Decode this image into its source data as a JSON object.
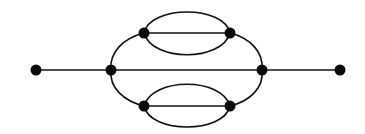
{
  "diagram": {
    "type": "graph",
    "colors": {
      "stroke": "#111111",
      "node": "#0a0a0a",
      "background": "#ffffff"
    },
    "nodes": [
      {
        "id": "left-end",
        "x": 36,
        "y": 70
      },
      {
        "id": "left-inner",
        "x": 111,
        "y": 70
      },
      {
        "id": "top-left",
        "x": 144,
        "y": 33
      },
      {
        "id": "top-right",
        "x": 230,
        "y": 33
      },
      {
        "id": "bottom-left",
        "x": 144,
        "y": 106
      },
      {
        "id": "bottom-right",
        "x": 230,
        "y": 106
      },
      {
        "id": "right-inner",
        "x": 262,
        "y": 70
      },
      {
        "id": "right-end",
        "x": 340,
        "y": 70
      }
    ],
    "edges": [
      {
        "from": "left-end",
        "to": "left-inner",
        "shape": "line"
      },
      {
        "from": "left-inner",
        "to": "right-inner",
        "shape": "line"
      },
      {
        "from": "right-inner",
        "to": "right-end",
        "shape": "line"
      },
      {
        "from": "left-inner",
        "to": "top-left",
        "shape": "arc"
      },
      {
        "from": "top-right",
        "to": "right-inner",
        "shape": "arc"
      },
      {
        "from": "left-inner",
        "to": "bottom-left",
        "shape": "arc"
      },
      {
        "from": "bottom-right",
        "to": "right-inner",
        "shape": "arc"
      },
      {
        "from": "top-left",
        "to": "top-right",
        "shape": "line"
      },
      {
        "from": "top-left",
        "to": "top-right",
        "shape": "arc-upper"
      },
      {
        "from": "top-left",
        "to": "top-right",
        "shape": "arc-lower"
      },
      {
        "from": "bottom-left",
        "to": "bottom-right",
        "shape": "line"
      },
      {
        "from": "bottom-left",
        "to": "bottom-right",
        "shape": "arc-upper"
      },
      {
        "from": "bottom-left",
        "to": "bottom-right",
        "shape": "arc-lower"
      }
    ]
  }
}
